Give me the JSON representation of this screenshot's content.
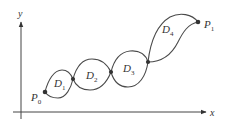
{
  "diagram": {
    "axes": {
      "x_label": "x",
      "y_label": "y"
    },
    "points": {
      "start": {
        "label": "P",
        "subscript": "0"
      },
      "end": {
        "label": "P",
        "subscript": "1"
      }
    },
    "regions": [
      {
        "label": "D",
        "subscript": "1"
      },
      {
        "label": "D",
        "subscript": "2"
      },
      {
        "label": "D",
        "subscript": "3"
      },
      {
        "label": "D",
        "subscript": "4"
      }
    ],
    "colors": {
      "stroke": "#4a4a4a",
      "text": "#333333",
      "background": "#ffffff"
    }
  }
}
